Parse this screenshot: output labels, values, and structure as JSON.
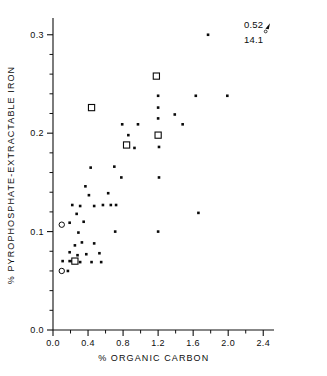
{
  "chart_data": {
    "type": "scatter",
    "title": "",
    "xlabel": "% ORGANIC CARBON",
    "ylabel": "% PYROPHOSPHATE-EXTRACTABLE IRON",
    "xlim": [
      0.0,
      2.5
    ],
    "ylim": [
      0.0,
      0.315
    ],
    "grid": false,
    "legend": "none",
    "x_ticks": [
      "0.0",
      "0.4",
      "0.8",
      "1.2",
      "1.6",
      "2.0",
      "2.4"
    ],
    "x_tick_values": [
      0.0,
      0.4,
      0.8,
      1.2,
      1.6,
      2.0,
      2.4
    ],
    "x_minor_step": 0.2,
    "y_ticks": [
      "0.0",
      "0.1",
      "0.2",
      "0.3"
    ],
    "y_tick_values": [
      0.0,
      0.1,
      0.2,
      0.3
    ],
    "y_minor_step": 0.02,
    "annotations": [
      {
        "text": "0.52",
        "x": 2.18,
        "y": 0.307
      },
      {
        "text": "14.1",
        "x": 2.18,
        "y": 0.292
      }
    ],
    "series": [
      {
        "name": "filled-points",
        "marker": "filled-square",
        "points": [
          [
            0.17,
            0.06
          ],
          [
            0.11,
            0.07
          ],
          [
            0.19,
            0.07
          ],
          [
            0.22,
            0.07
          ],
          [
            0.26,
            0.07
          ],
          [
            0.31,
            0.069
          ],
          [
            0.44,
            0.069
          ],
          [
            0.55,
            0.069
          ],
          [
            0.19,
            0.079
          ],
          [
            0.38,
            0.077
          ],
          [
            0.28,
            0.076
          ],
          [
            0.33,
            0.089
          ],
          [
            0.25,
            0.086
          ],
          [
            0.47,
            0.088
          ],
          [
            0.53,
            0.078
          ],
          [
            0.29,
            0.099
          ],
          [
            0.71,
            0.1
          ],
          [
            1.2,
            0.1
          ],
          [
            0.19,
            0.109
          ],
          [
            0.35,
            0.11
          ],
          [
            1.66,
            0.119
          ],
          [
            0.22,
            0.127
          ],
          [
            0.31,
            0.126
          ],
          [
            0.47,
            0.126
          ],
          [
            0.57,
            0.127
          ],
          [
            0.66,
            0.127
          ],
          [
            0.72,
            0.127
          ],
          [
            0.27,
            0.118
          ],
          [
            0.41,
            0.137
          ],
          [
            0.63,
            0.139
          ],
          [
            0.37,
            0.146
          ],
          [
            0.78,
            0.155
          ],
          [
            1.21,
            0.155
          ],
          [
            0.43,
            0.165
          ],
          [
            0.7,
            0.166
          ],
          [
            0.93,
            0.185
          ],
          [
            1.21,
            0.186
          ],
          [
            0.86,
            0.198
          ],
          [
            0.79,
            0.209
          ],
          [
            0.97,
            0.209
          ],
          [
            1.48,
            0.209
          ],
          [
            1.2,
            0.215
          ],
          [
            1.39,
            0.219
          ],
          [
            1.2,
            0.226
          ],
          [
            1.2,
            0.238
          ],
          [
            1.63,
            0.238
          ],
          [
            1.99,
            0.238
          ],
          [
            1.77,
            0.3
          ]
        ]
      },
      {
        "name": "open-circles",
        "marker": "open-circle",
        "points": [
          [
            0.1,
            0.107
          ],
          [
            0.1,
            0.06
          ]
        ]
      },
      {
        "name": "open-squares",
        "marker": "open-square",
        "points": [
          [
            0.25,
            0.07
          ],
          [
            0.44,
            0.226
          ],
          [
            0.84,
            0.188
          ],
          [
            1.18,
            0.258
          ],
          [
            1.2,
            0.198
          ]
        ]
      }
    ]
  },
  "plot_geometry": {
    "x_px_min": 53,
    "x_px_max": 272,
    "y_px_min": 20,
    "y_px_max": 330
  }
}
